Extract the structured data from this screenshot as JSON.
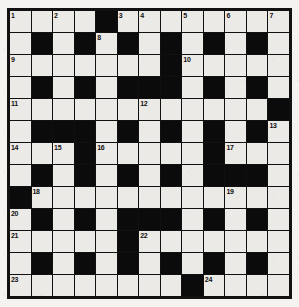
{
  "puzzle": {
    "title": "Crossword Grid",
    "type": "crossword",
    "columns": 13,
    "rows": 13,
    "colors": {
      "page_background": "#f2f1ef",
      "cell_light": "#eceae6",
      "cell_block": "#0b0b0b",
      "grid_line": "#101010",
      "number_text": "#101010"
    },
    "legend": {
      "white_cell": "letter cell",
      "black_cell": "block"
    },
    "clue_numbers": [
      1,
      2,
      3,
      4,
      5,
      6,
      7,
      8,
      9,
      10,
      11,
      12,
      13,
      14,
      15,
      16,
      17,
      18,
      19,
      20,
      21,
      22,
      23,
      24
    ],
    "grid": [
      [
        {
          "block": false,
          "num": "1"
        },
        {
          "block": false,
          "num": ""
        },
        {
          "block": false,
          "num": "2"
        },
        {
          "block": false,
          "num": ""
        },
        {
          "block": true,
          "num": ""
        },
        {
          "block": false,
          "num": "3"
        },
        {
          "block": false,
          "num": "4"
        },
        {
          "block": false,
          "num": ""
        },
        {
          "block": false,
          "num": "5"
        },
        {
          "block": false,
          "num": ""
        },
        {
          "block": false,
          "num": "6"
        },
        {
          "block": false,
          "num": ""
        },
        {
          "block": false,
          "num": "7"
        }
      ],
      [
        {
          "block": false,
          "num": ""
        },
        {
          "block": true,
          "num": ""
        },
        {
          "block": false,
          "num": ""
        },
        {
          "block": true,
          "num": ""
        },
        {
          "block": false,
          "num": "8"
        },
        {
          "block": true,
          "num": ""
        },
        {
          "block": false,
          "num": ""
        },
        {
          "block": true,
          "num": ""
        },
        {
          "block": false,
          "num": ""
        },
        {
          "block": true,
          "num": ""
        },
        {
          "block": false,
          "num": ""
        },
        {
          "block": true,
          "num": ""
        },
        {
          "block": false,
          "num": ""
        }
      ],
      [
        {
          "block": false,
          "num": "9"
        },
        {
          "block": false,
          "num": ""
        },
        {
          "block": false,
          "num": ""
        },
        {
          "block": false,
          "num": ""
        },
        {
          "block": false,
          "num": ""
        },
        {
          "block": false,
          "num": ""
        },
        {
          "block": false,
          "num": ""
        },
        {
          "block": true,
          "num": ""
        },
        {
          "block": false,
          "num": "10"
        },
        {
          "block": false,
          "num": ""
        },
        {
          "block": false,
          "num": ""
        },
        {
          "block": false,
          "num": ""
        },
        {
          "block": false,
          "num": ""
        }
      ],
      [
        {
          "block": false,
          "num": ""
        },
        {
          "block": true,
          "num": ""
        },
        {
          "block": false,
          "num": ""
        },
        {
          "block": true,
          "num": ""
        },
        {
          "block": false,
          "num": ""
        },
        {
          "block": true,
          "num": ""
        },
        {
          "block": true,
          "num": ""
        },
        {
          "block": true,
          "num": ""
        },
        {
          "block": false,
          "num": ""
        },
        {
          "block": true,
          "num": ""
        },
        {
          "block": false,
          "num": ""
        },
        {
          "block": true,
          "num": ""
        },
        {
          "block": false,
          "num": ""
        }
      ],
      [
        {
          "block": false,
          "num": "11"
        },
        {
          "block": false,
          "num": ""
        },
        {
          "block": false,
          "num": ""
        },
        {
          "block": false,
          "num": ""
        },
        {
          "block": false,
          "num": ""
        },
        {
          "block": false,
          "num": ""
        },
        {
          "block": false,
          "num": "12"
        },
        {
          "block": false,
          "num": ""
        },
        {
          "block": false,
          "num": ""
        },
        {
          "block": false,
          "num": ""
        },
        {
          "block": false,
          "num": ""
        },
        {
          "block": false,
          "num": ""
        },
        {
          "block": true,
          "num": ""
        }
      ],
      [
        {
          "block": false,
          "num": ""
        },
        {
          "block": true,
          "num": ""
        },
        {
          "block": true,
          "num": ""
        },
        {
          "block": true,
          "num": ""
        },
        {
          "block": false,
          "num": ""
        },
        {
          "block": true,
          "num": ""
        },
        {
          "block": false,
          "num": ""
        },
        {
          "block": true,
          "num": ""
        },
        {
          "block": false,
          "num": ""
        },
        {
          "block": true,
          "num": ""
        },
        {
          "block": false,
          "num": ""
        },
        {
          "block": true,
          "num": ""
        },
        {
          "block": false,
          "num": "13"
        }
      ],
      [
        {
          "block": false,
          "num": "14"
        },
        {
          "block": false,
          "num": ""
        },
        {
          "block": false,
          "num": "15"
        },
        {
          "block": true,
          "num": ""
        },
        {
          "block": false,
          "num": "16"
        },
        {
          "block": false,
          "num": ""
        },
        {
          "block": false,
          "num": ""
        },
        {
          "block": false,
          "num": ""
        },
        {
          "block": false,
          "num": ""
        },
        {
          "block": true,
          "num": ""
        },
        {
          "block": false,
          "num": "17"
        },
        {
          "block": false,
          "num": ""
        },
        {
          "block": false,
          "num": ""
        }
      ],
      [
        {
          "block": false,
          "num": ""
        },
        {
          "block": true,
          "num": ""
        },
        {
          "block": false,
          "num": ""
        },
        {
          "block": true,
          "num": ""
        },
        {
          "block": false,
          "num": ""
        },
        {
          "block": true,
          "num": ""
        },
        {
          "block": false,
          "num": ""
        },
        {
          "block": true,
          "num": ""
        },
        {
          "block": false,
          "num": ""
        },
        {
          "block": true,
          "num": ""
        },
        {
          "block": true,
          "num": ""
        },
        {
          "block": true,
          "num": ""
        },
        {
          "block": false,
          "num": ""
        }
      ],
      [
        {
          "block": true,
          "num": ""
        },
        {
          "block": false,
          "num": "18"
        },
        {
          "block": false,
          "num": ""
        },
        {
          "block": false,
          "num": ""
        },
        {
          "block": false,
          "num": ""
        },
        {
          "block": false,
          "num": ""
        },
        {
          "block": false,
          "num": ""
        },
        {
          "block": false,
          "num": ""
        },
        {
          "block": false,
          "num": ""
        },
        {
          "block": false,
          "num": ""
        },
        {
          "block": false,
          "num": "19"
        },
        {
          "block": false,
          "num": ""
        },
        {
          "block": false,
          "num": ""
        }
      ],
      [
        {
          "block": false,
          "num": "20"
        },
        {
          "block": true,
          "num": ""
        },
        {
          "block": false,
          "num": ""
        },
        {
          "block": true,
          "num": ""
        },
        {
          "block": false,
          "num": ""
        },
        {
          "block": true,
          "num": ""
        },
        {
          "block": true,
          "num": ""
        },
        {
          "block": true,
          "num": ""
        },
        {
          "block": false,
          "num": ""
        },
        {
          "block": true,
          "num": ""
        },
        {
          "block": false,
          "num": ""
        },
        {
          "block": true,
          "num": ""
        },
        {
          "block": false,
          "num": ""
        }
      ],
      [
        {
          "block": false,
          "num": "21"
        },
        {
          "block": false,
          "num": ""
        },
        {
          "block": false,
          "num": ""
        },
        {
          "block": false,
          "num": ""
        },
        {
          "block": false,
          "num": ""
        },
        {
          "block": true,
          "num": ""
        },
        {
          "block": false,
          "num": "22"
        },
        {
          "block": false,
          "num": ""
        },
        {
          "block": false,
          "num": ""
        },
        {
          "block": false,
          "num": ""
        },
        {
          "block": false,
          "num": ""
        },
        {
          "block": false,
          "num": ""
        },
        {
          "block": false,
          "num": ""
        }
      ],
      [
        {
          "block": false,
          "num": ""
        },
        {
          "block": true,
          "num": ""
        },
        {
          "block": false,
          "num": ""
        },
        {
          "block": true,
          "num": ""
        },
        {
          "block": false,
          "num": ""
        },
        {
          "block": true,
          "num": ""
        },
        {
          "block": false,
          "num": ""
        },
        {
          "block": true,
          "num": ""
        },
        {
          "block": false,
          "num": ""
        },
        {
          "block": true,
          "num": ""
        },
        {
          "block": false,
          "num": ""
        },
        {
          "block": true,
          "num": ""
        },
        {
          "block": false,
          "num": ""
        }
      ],
      [
        {
          "block": false,
          "num": "23"
        },
        {
          "block": false,
          "num": ""
        },
        {
          "block": false,
          "num": ""
        },
        {
          "block": false,
          "num": ""
        },
        {
          "block": false,
          "num": ""
        },
        {
          "block": false,
          "num": ""
        },
        {
          "block": false,
          "num": ""
        },
        {
          "block": false,
          "num": ""
        },
        {
          "block": true,
          "num": ""
        },
        {
          "block": false,
          "num": "24"
        },
        {
          "block": false,
          "num": ""
        },
        {
          "block": false,
          "num": ""
        },
        {
          "block": false,
          "num": ""
        }
      ]
    ]
  }
}
